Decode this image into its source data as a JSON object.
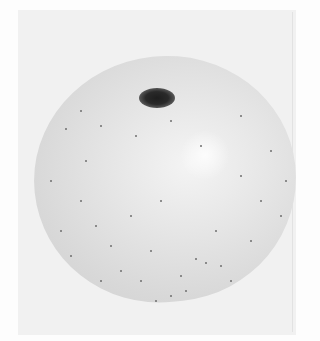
{
  "image": {
    "subject": "apple",
    "description": "Grayscale photograph of a round speckled apple viewed from above with the stem cavity near the top",
    "colors": {
      "background": "#f1f1f1",
      "apple_light": "#f4f4f4",
      "apple_shade": "#cfcfcf",
      "stem_cavity": "#1e1e1e"
    }
  }
}
